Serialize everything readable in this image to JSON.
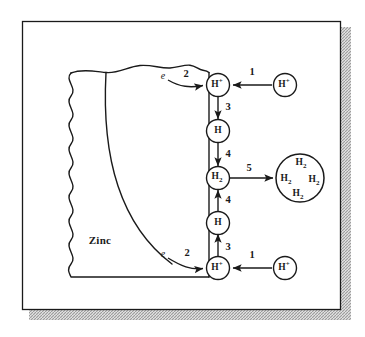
{
  "figure": {
    "type": "process-diagram",
    "frame": {
      "border_color": "#1a1a1a",
      "shadow_color": "#b9b9b9",
      "background": "#ffffff"
    }
  },
  "metal": {
    "label": "Zinc",
    "description": "Zinc metal block with irregular wavy left edge, rough top edge and a grain-boundary curve",
    "interface_label": "metal-solution-interface"
  },
  "species": {
    "h_plus_surface_top": "H",
    "h_plus_surface_top_charge": "+",
    "h_plus_bulk_top": "H",
    "h_plus_bulk_top_charge": "+",
    "h_atom_top": "H",
    "h2_surface": "H",
    "h2_surface_sub": "2",
    "h_atom_bottom": "H",
    "h_plus_surface_bottom": "H",
    "h_plus_surface_bottom_charge": "+",
    "h_plus_bulk_bottom": "H",
    "h_plus_bulk_bottom_charge": "+"
  },
  "bubble": {
    "name": "hydrogen-gas-bubble",
    "molecules": [
      {
        "text": "H",
        "sub": "2"
      },
      {
        "text": "H",
        "sub": "2"
      },
      {
        "text": "H",
        "sub": "2"
      },
      {
        "text": "H",
        "sub": "2"
      }
    ]
  },
  "electrons": {
    "top": "e",
    "bottom": "e"
  },
  "steps": [
    {
      "id": "step-1-top",
      "label": "1",
      "meaning": "transport of H+ from bulk solution to surface"
    },
    {
      "id": "step-2-top",
      "label": "2",
      "meaning": "electron transfer from zinc to adsorbed H+"
    },
    {
      "id": "step-3-top",
      "label": "3",
      "meaning": "H+ reduced to adsorbed H atom"
    },
    {
      "id": "step-4-top",
      "label": "4",
      "meaning": "combination of H atoms to form H2"
    },
    {
      "id": "step-5",
      "label": "5",
      "meaning": "H2 coalesces into a gas bubble"
    },
    {
      "id": "step-4-bottom",
      "label": "4",
      "meaning": "combination of H atoms to form H2"
    },
    {
      "id": "step-3-bottom",
      "label": "3",
      "meaning": "H+ reduced to adsorbed H atom"
    },
    {
      "id": "step-2-bottom",
      "label": "2",
      "meaning": "electron transfer from zinc to adsorbed H+"
    },
    {
      "id": "step-1-bottom",
      "label": "1",
      "meaning": "transport of H+ from bulk solution to surface"
    }
  ]
}
